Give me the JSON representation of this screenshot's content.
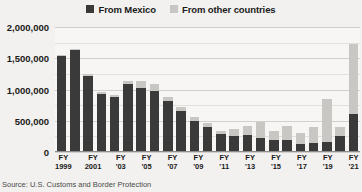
{
  "legend": {
    "items": [
      {
        "label": "From Mexico",
        "color": "#3a3a3a",
        "icon": "square-swatch-icon"
      },
      {
        "label": "From other countries",
        "color": "#c9c7c4",
        "icon": "square-swatch-icon"
      }
    ]
  },
  "source": {
    "text": "Source: U.S. Customs and Border Protection"
  },
  "colors": {
    "mexico": "#3a3a3a",
    "other": "#c9c7c4",
    "grid": "#d2d0cd",
    "background": "#f2f1ef",
    "plot_background": "#f7f6f4"
  },
  "chart_data": {
    "type": "bar",
    "title": "",
    "subtitle": "",
    "xlabel": "",
    "ylabel": "",
    "ylim": [
      0,
      2000000
    ],
    "ytick_values": [
      0,
      500000,
      1000000,
      1500000,
      2000000
    ],
    "ytick_labels": [
      "0",
      "500,000",
      "1,000,000",
      "1,500,000",
      "2,000,000"
    ],
    "grid": true,
    "stacked": true,
    "legend_position": "top-center",
    "categories": [
      "FY 1999",
      "FY 2000",
      "FY 2001",
      "FY 2002",
      "FY '03",
      "FY '04",
      "FY '05",
      "FY '06",
      "FY '07",
      "FY '08",
      "FY '09",
      "FY '10",
      "FY '11",
      "FY '12",
      "FY '13",
      "FY '14",
      "FY '15",
      "FY '16",
      "FY '17",
      "FY '18",
      "FY '19",
      "FY '20",
      "FY '21"
    ],
    "tick_labels": [
      {
        "fy": "FY",
        "year": "1999"
      },
      {
        "fy": "",
        "year": ""
      },
      {
        "fy": "FY",
        "year": "2001"
      },
      {
        "fy": "",
        "year": ""
      },
      {
        "fy": "FY",
        "year": "'03"
      },
      {
        "fy": "",
        "year": ""
      },
      {
        "fy": "FY",
        "year": "'05"
      },
      {
        "fy": "",
        "year": ""
      },
      {
        "fy": "FY",
        "year": "'07"
      },
      {
        "fy": "",
        "year": ""
      },
      {
        "fy": "FY",
        "year": "'09"
      },
      {
        "fy": "",
        "year": ""
      },
      {
        "fy": "FY",
        "year": "'11"
      },
      {
        "fy": "",
        "year": ""
      },
      {
        "fy": "FY",
        "year": "'13"
      },
      {
        "fy": "",
        "year": ""
      },
      {
        "fy": "FY",
        "year": "'15"
      },
      {
        "fy": "",
        "year": ""
      },
      {
        "fy": "FY",
        "year": "'17"
      },
      {
        "fy": "",
        "year": ""
      },
      {
        "fy": "FY",
        "year": "'19"
      },
      {
        "fy": "",
        "year": ""
      },
      {
        "fy": "FY",
        "year": "'21"
      }
    ],
    "series": [
      {
        "name": "From Mexico",
        "color": "#3a3a3a",
        "values": [
          1537000,
          1636000,
          1224000,
          930000,
          882000,
          1085000,
          1023000,
          981000,
          809000,
          662000,
          503000,
          405000,
          286000,
          262000,
          265000,
          226000,
          188000,
          192000,
          128000,
          152000,
          166000,
          253000,
          608000
        ]
      },
      {
        "name": "From other countries",
        "color": "#c9c7c4",
        "values": [
          12000,
          13000,
          20000,
          25000,
          24000,
          54000,
          116000,
          108000,
          68000,
          61000,
          53000,
          58000,
          54000,
          103000,
          149000,
          262000,
          143000,
          223000,
          175000,
          245000,
          690000,
          147000,
          1126000
        ]
      }
    ],
    "totals": [
      1549000,
      1649000,
      1244000,
      955000,
      906000,
      1139000,
      1139000,
      1089000,
      877000,
      723000,
      556000,
      463000,
      340000,
      365000,
      414000,
      488000,
      331000,
      415000,
      303000,
      397000,
      856000,
      400000,
      1734000
    ]
  }
}
